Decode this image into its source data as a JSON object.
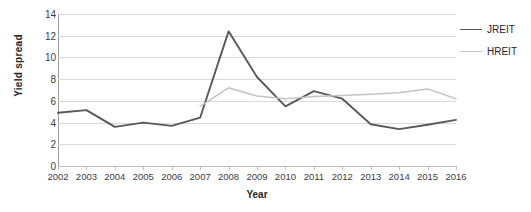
{
  "chart_data": {
    "type": "line",
    "title": "",
    "xlabel": "Year",
    "ylabel": "Yield spread",
    "categories": [
      "2002",
      "2003",
      "2004",
      "2005",
      "2006",
      "2007",
      "2008",
      "2009",
      "2010",
      "2011",
      "2012",
      "2013",
      "2014",
      "2015",
      "2016"
    ],
    "series": [
      {
        "name": "JREIT",
        "color": "#595959",
        "width": 1.9,
        "values": [
          4.9,
          5.15,
          3.6,
          4.0,
          3.7,
          4.45,
          12.4,
          8.2,
          5.5,
          6.9,
          6.2,
          3.85,
          3.4,
          3.8,
          4.25
        ]
      },
      {
        "name": "HREIT",
        "color": "#c4c4c4",
        "width": 1.5,
        "values": [
          null,
          null,
          null,
          null,
          null,
          5.5,
          7.2,
          6.45,
          6.2,
          6.4,
          6.5,
          6.6,
          6.75,
          7.1,
          6.2
        ]
      }
    ],
    "ylim": [
      0,
      14
    ],
    "yticks": [
      0,
      2,
      4,
      6,
      8,
      10,
      12,
      14
    ],
    "grid": "horizontal",
    "legend_position": "right"
  },
  "legend": {
    "items": [
      {
        "label": "JREIT"
      },
      {
        "label": "HREIT"
      }
    ]
  },
  "colors": {
    "jreit": "#595959",
    "hreit": "#c4c4c4",
    "gridline": "#d9d9d9",
    "axis": "#9a9a9a",
    "text": "#404040",
    "background": "#ffffff"
  }
}
